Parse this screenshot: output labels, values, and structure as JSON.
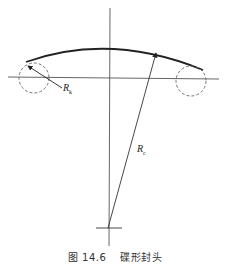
{
  "figure": {
    "caption_number": "图 14.6",
    "caption_title": "碟形封头",
    "labels": {
      "knuckle_radius": "R",
      "knuckle_radius_sub": "k",
      "crown_radius": "R",
      "crown_radius_sub": "c"
    },
    "colors": {
      "line": "#222222",
      "axis": "#555555",
      "dashed": "#666666"
    }
  }
}
